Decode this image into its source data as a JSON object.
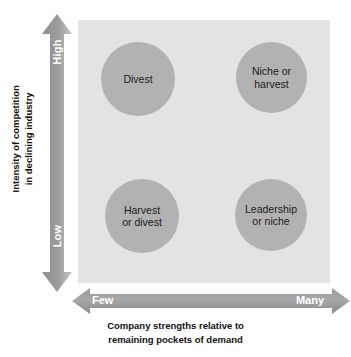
{
  "diagram": {
    "type": "2x2-matrix",
    "panel": {
      "background_color": "#e3e3e3"
    },
    "bubble_color": "#b2b2b2",
    "arrow_color_dark": "#8f8f8f",
    "arrow_color_light": "#c9c9c9",
    "quadrants": [
      {
        "position": "top-left",
        "label_line1": "Divest",
        "label_line2": ""
      },
      {
        "position": "top-right",
        "label_line1": "Niche or",
        "label_line2": "harvest"
      },
      {
        "position": "bottom-left",
        "label_line1": "Harvest",
        "label_line2": "or divest"
      },
      {
        "position": "bottom-right",
        "label_line1": "Leadership",
        "label_line2": "or niche"
      }
    ],
    "y_axis": {
      "title_line1": "Intensity of competition",
      "title_line2": "in declining industry",
      "high_label": "High",
      "low_label": "Low"
    },
    "x_axis": {
      "title_line1": "Company strengths relative to",
      "title_line2": "remaining pockets of demand",
      "low_label": "Few",
      "high_label": "Many"
    }
  }
}
